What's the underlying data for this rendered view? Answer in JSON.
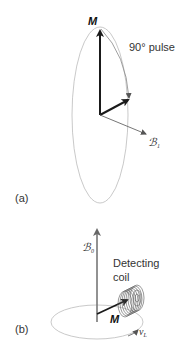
{
  "panel_a": {
    "label": "(a)",
    "magnetization_label": "M",
    "pulse_label": "90° pulse",
    "field_label": "ℬ",
    "field_subscript": "1"
  },
  "panel_b": {
    "label": "(b)",
    "field_label": "ℬ",
    "field_subscript": "0",
    "coil_label_line1": "Detecting",
    "coil_label_line2": "coil",
    "magnetization_label": "M",
    "frequency_label": "ν",
    "frequency_subscript": "L"
  },
  "colors": {
    "arrow_dark": "#1a1a1a",
    "arrow_gray": "#777777",
    "ellipse": "#bbbbbb",
    "text": "#333333"
  }
}
